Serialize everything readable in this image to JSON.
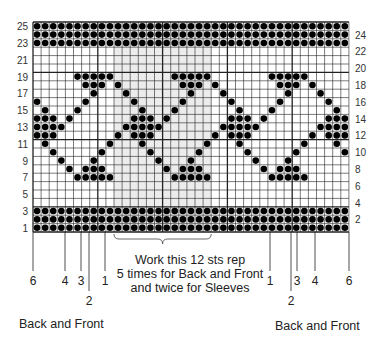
{
  "chart_data": {
    "type": "table",
    "grid": {
      "columns": 39,
      "rows": 25,
      "repeat_width": 12,
      "repeat_start_col": 10,
      "repeat_end_col": 21
    },
    "row_labels_left": [
      "1",
      "3",
      "5",
      "7",
      "9",
      "11",
      "13",
      "15",
      "17",
      "19",
      "21",
      "23",
      "25"
    ],
    "row_labels_right": [
      "2",
      "4",
      "6",
      "8",
      "10",
      "12",
      "14",
      "16",
      "18",
      "20",
      "22",
      "24"
    ],
    "solid_rows": [
      1,
      2,
      3,
      23,
      24,
      25
    ],
    "motif_period": 12,
    "motif_rows": {
      "19": [
        5,
        6,
        7,
        8,
        9
      ],
      "18": [
        6,
        7,
        8,
        10
      ],
      "17": [
        7,
        11
      ],
      "16": [
        0,
        6
      ],
      "15": [
        1,
        5
      ],
      "14": [
        0,
        1,
        2,
        4
      ],
      "13": [
        0,
        1,
        2,
        3,
        11
      ],
      "12": [
        0,
        1,
        2,
        10
      ],
      "11": [
        1,
        9
      ],
      "10": [
        2,
        8
      ],
      "9": [
        3,
        7
      ],
      "8": [
        4,
        6,
        7,
        8
      ],
      "7": [
        5,
        6,
        7,
        8,
        9
      ]
    },
    "legend": "filled circle = contrast color stitch"
  },
  "labels": {
    "left_size_marks": [
      "6",
      "4",
      "3",
      "2",
      "1"
    ],
    "right_size_marks": [
      "1",
      "2",
      "3",
      "4",
      "6"
    ],
    "caption_line1": "Work this 12 sts rep",
    "caption_line2": "5 times for Back and Front",
    "caption_line3": "and twice for Sleeves",
    "foot_left": "Back and Front",
    "foot_right": "Back and Front"
  }
}
